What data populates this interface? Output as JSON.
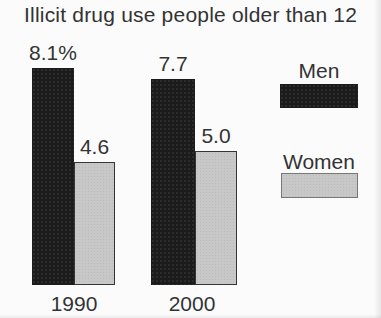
{
  "chart_data": {
    "type": "bar",
    "title": "Illicit drug use people older than 12",
    "categories": [
      "1990",
      "2000"
    ],
    "series": [
      {
        "name": "Men",
        "color": "#1b1b1b",
        "values": [
          8.1,
          7.7
        ],
        "value_labels": [
          "8.1%",
          "7.7"
        ]
      },
      {
        "name": "Women",
        "color": "#c8c8c8",
        "values": [
          4.6,
          5.0
        ],
        "value_labels": [
          "4.6",
          "5.0"
        ]
      }
    ],
    "unit": "percent",
    "ylim": [
      0,
      8.5
    ],
    "grid": false,
    "axis_lines": false,
    "legend_position": "right",
    "background_color": "#fbfbfb",
    "text_color": "#333333"
  }
}
